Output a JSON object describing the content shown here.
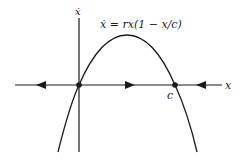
{
  "diagram": {
    "type": "phase-line",
    "equation": "ẋ = rx(1 − x/c)",
    "axes": {
      "horizontal_label": "x",
      "vertical_label": "ẋ"
    },
    "fixed_points": [
      {
        "label": "",
        "position": "origin",
        "stability": "unstable"
      },
      {
        "label": "c",
        "position": "c",
        "stability": "stable"
      }
    ],
    "flow_arrows": [
      {
        "region": "x < 0",
        "direction": "left"
      },
      {
        "region": "0 < x < c",
        "direction": "right"
      },
      {
        "region": "x > c",
        "direction": "left"
      }
    ],
    "colors": {
      "line": "#1a1a1a",
      "background": "#ffffff"
    }
  }
}
